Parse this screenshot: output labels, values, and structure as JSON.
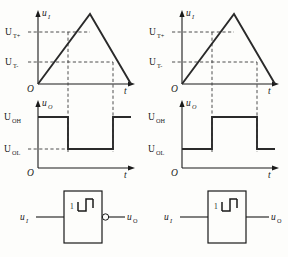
{
  "figure": {
    "panels": [
      {
        "id": "left",
        "type": "inverting",
        "input_plot": {
          "y_axis_label": "u",
          "y_axis_sub": "I",
          "x_axis_label": "t",
          "origin_label": "O",
          "ticks": [
            {
              "label_main": "U",
              "label_sub": "T+",
              "value": "U_T+"
            },
            {
              "label_main": "U",
              "label_sub": "T-",
              "value": "U_T−"
            }
          ],
          "waveform": "triangle"
        },
        "output_plot": {
          "y_axis_label": "u",
          "y_axis_sub": "O",
          "x_axis_label": "t",
          "origin_label": "O",
          "ticks": [
            {
              "label_main": "U",
              "label_sub": "OH",
              "value": "U_OH"
            },
            {
              "label_main": "U",
              "label_sub": "OL",
              "value": "U_OL"
            }
          ],
          "waveform": "high-low-high"
        },
        "symbol": {
          "input_label_main": "u",
          "input_label_sub": "I",
          "output_label_main": "u",
          "output_label_sub": "O",
          "gate_number": "1",
          "glyph": "hysteresis-icon",
          "inverting_bubble": true
        }
      },
      {
        "id": "right",
        "type": "non-inverting",
        "input_plot": {
          "y_axis_label": "u",
          "y_axis_sub": "I",
          "x_axis_label": "t",
          "origin_label": "O",
          "ticks": [
            {
              "label_main": "U",
              "label_sub": "T+",
              "value": "U_T+"
            },
            {
              "label_main": "U",
              "label_sub": "T-",
              "value": "U_T−"
            }
          ],
          "waveform": "triangle"
        },
        "output_plot": {
          "y_axis_label": "u",
          "y_axis_sub": "O",
          "x_axis_label": "t",
          "origin_label": "O",
          "ticks": [
            {
              "label_main": "U",
              "label_sub": "OH",
              "value": "U_OH"
            },
            {
              "label_main": "U",
              "label_sub": "OL",
              "value": "U_OL"
            }
          ],
          "waveform": "low-high-low"
        },
        "symbol": {
          "input_label_main": "u",
          "input_label_sub": "I",
          "output_label_main": "u",
          "output_label_sub": "O",
          "gate_number": "1",
          "glyph": "hysteresis-icon",
          "inverting_bubble": false
        }
      }
    ],
    "colors": {
      "ink": "#1a1a1a",
      "wave": "#2a2a2a",
      "dash": "#3a3a3a",
      "background": "#fdfdfb"
    }
  },
  "caption": {
    "text": ""
  }
}
